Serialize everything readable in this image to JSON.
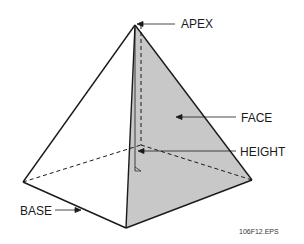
{
  "diagram": {
    "labels": {
      "apex": "APEX",
      "face": "FACE",
      "height": "HEIGHT",
      "base": "BASE"
    },
    "figure_id": "106F12.EPS",
    "colors": {
      "shaded_face": "#c8c8c8",
      "edge": "#1a1a1a",
      "background": "#ffffff"
    }
  }
}
